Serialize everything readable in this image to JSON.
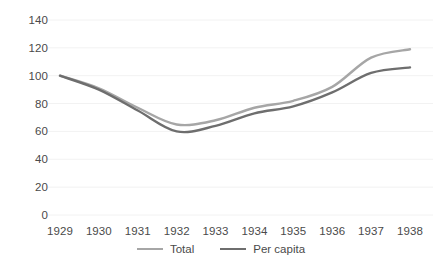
{
  "chart_data": {
    "type": "line",
    "title": "",
    "subtitle": "",
    "xlabel": "",
    "ylabel": "",
    "categories": [
      "1929",
      "1930",
      "1931",
      "1932",
      "1933",
      "1934",
      "1935",
      "1936",
      "1937",
      "1938"
    ],
    "x": [
      1929,
      1930,
      1931,
      1932,
      1933,
      1934,
      1935,
      1936,
      1937,
      1938
    ],
    "series": [
      {
        "name": "Total",
        "color": "#a6a6a6",
        "values": [
          100,
          91,
          77,
          65,
          68,
          77,
          82,
          92,
          113,
          119
        ]
      },
      {
        "name": "Per capita",
        "color": "#6e6e6e",
        "values": [
          100,
          90,
          75,
          60,
          64,
          73,
          78,
          88,
          102,
          106
        ]
      }
    ],
    "ylim": [
      0,
      140
    ],
    "yticks": [
      0,
      20,
      40,
      60,
      80,
      100,
      120,
      140
    ],
    "ytick_labels": [
      "0",
      "20",
      "40",
      "60",
      "80",
      "100",
      "120",
      "140"
    ],
    "xtick_labels": [
      "1929",
      "1930",
      "1931",
      "1932",
      "1933",
      "1934",
      "1935",
      "1936",
      "1937",
      "1938"
    ],
    "grid": true,
    "grid_color": "#f2f2f2",
    "legend_position": "bottom",
    "legend_entries": [
      "Total",
      "Per capita"
    ],
    "annotations": [],
    "background_color": "#ffffff",
    "tick_label_color": "#4a4a4a"
  }
}
